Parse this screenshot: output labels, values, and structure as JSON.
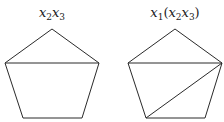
{
  "diagrams": [
    {
      "label_parts": [
        {
          "v": "x",
          "s": "2"
        },
        {
          "v": "x",
          "s": "3"
        }
      ],
      "label_text": "x2x3",
      "label_pos": [
        52,
        6
      ],
      "polygon": [
        [
          52,
          29
        ],
        [
          99,
          63
        ],
        [
          82,
          118
        ],
        [
          23,
          118
        ],
        [
          5,
          63
        ]
      ],
      "diagonals": [
        [
          [
            5,
            63
          ],
          [
            99,
            63
          ]
        ]
      ]
    },
    {
      "label_parts": [
        {
          "v": "x",
          "s": "1"
        },
        {
          "v": "(",
          "s": ""
        },
        {
          "v": "x",
          "s": "2"
        },
        {
          "v": "x",
          "s": "3"
        },
        {
          "v": ")",
          "s": ""
        }
      ],
      "label_text": "x1(x2x3)",
      "label_pos": [
        175,
        6
      ],
      "polygon": [
        [
          175,
          29
        ],
        [
          222,
          63
        ],
        [
          205,
          118
        ],
        [
          146,
          118
        ],
        [
          128,
          63
        ]
      ],
      "diagonals": [
        [
          [
            128,
            63
          ],
          [
            222,
            63
          ]
        ],
        [
          [
            146,
            118
          ],
          [
            222,
            63
          ]
        ]
      ]
    }
  ],
  "colors": {
    "stroke": "#2a2a2a",
    "text": "#1a1a1a"
  }
}
